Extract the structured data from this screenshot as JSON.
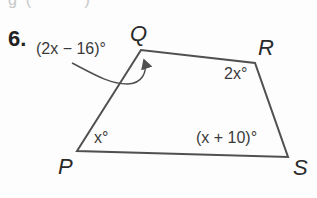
{
  "problem": {
    "number": "6.",
    "figure": "quadrilateral PQRS",
    "vertices": [
      {
        "label": "P",
        "x": 77,
        "y": 151
      },
      {
        "label": "Q",
        "x": 141,
        "y": 50
      },
      {
        "label": "R",
        "x": 255,
        "y": 63
      },
      {
        "label": "S",
        "x": 288,
        "y": 157
      }
    ],
    "angles": {
      "Q": "(2x − 16)°",
      "R": "2x°",
      "P": "x°",
      "S": "(x + 10)°"
    },
    "colors": {
      "stroke": "#505050",
      "text": "#2a2a2a"
    }
  }
}
